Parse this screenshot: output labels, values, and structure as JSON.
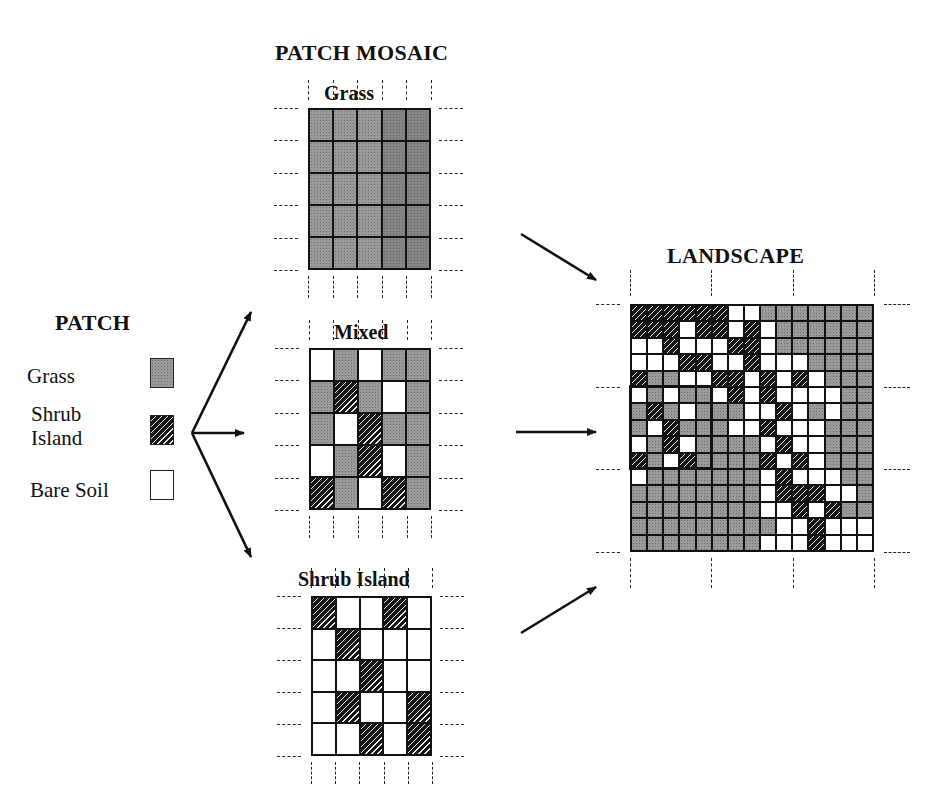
{
  "titles": {
    "patch": "PATCH",
    "patch_mosaic": "PATCH MOSAIC",
    "landscape": "LANDSCAPE"
  },
  "legend": {
    "items": [
      {
        "label": "Grass",
        "type": "G"
      },
      {
        "label": "Shrub Island",
        "label_lines": [
          "Shrub",
          "Island"
        ],
        "type": "S"
      },
      {
        "label": "Bare Soil",
        "type": "W"
      }
    ]
  },
  "mosaics": [
    {
      "label": "Grass",
      "rows": [
        [
          "G",
          "G",
          "G",
          "G",
          "G"
        ],
        [
          "G",
          "G",
          "G",
          "G",
          "G"
        ],
        [
          "G",
          "G",
          "G",
          "G",
          "G"
        ],
        [
          "G",
          "G",
          "G",
          "G",
          "G"
        ],
        [
          "G",
          "G",
          "G",
          "G",
          "G"
        ]
      ]
    },
    {
      "label": "Mixed",
      "rows": [
        [
          "W",
          "G",
          "W",
          "G",
          "G"
        ],
        [
          "G",
          "S",
          "G",
          "W",
          "G"
        ],
        [
          "G",
          "W",
          "S",
          "G",
          "G"
        ],
        [
          "W",
          "G",
          "S",
          "W",
          "G"
        ],
        [
          "S",
          "G",
          "W",
          "S",
          "G"
        ]
      ]
    },
    {
      "label": "Shrub Island",
      "rows": [
        [
          "S",
          "W",
          "W",
          "S",
          "W"
        ],
        [
          "W",
          "S",
          "W",
          "W",
          "W"
        ],
        [
          "W",
          "W",
          "S",
          "W",
          "W"
        ],
        [
          "W",
          "S",
          "W",
          "W",
          "S"
        ],
        [
          "W",
          "W",
          "S",
          "W",
          "S"
        ]
      ]
    }
  ],
  "landscape": {
    "rows": [
      [
        "S",
        "S",
        "S",
        "S",
        "S",
        "S",
        "W",
        "W",
        "G",
        "G",
        "G",
        "G",
        "G",
        "G",
        "G"
      ],
      [
        "S",
        "S",
        "S",
        "W",
        "S",
        "S",
        "W",
        "S",
        "W",
        "G",
        "G",
        "G",
        "G",
        "G",
        "G"
      ],
      [
        "W",
        "W",
        "S",
        "W",
        "W",
        "W",
        "S",
        "S",
        "W",
        "G",
        "G",
        "G",
        "G",
        "G",
        "G"
      ],
      [
        "W",
        "W",
        "W",
        "S",
        "S",
        "W",
        "W",
        "S",
        "W",
        "W",
        "W",
        "G",
        "G",
        "G",
        "G"
      ],
      [
        "S",
        "G",
        "G",
        "W",
        "W",
        "S",
        "S",
        "W",
        "S",
        "W",
        "S",
        "W",
        "G",
        "G",
        "G"
      ],
      [
        "W",
        "G",
        "W",
        "G",
        "G",
        "W",
        "S",
        "W",
        "S",
        "W",
        "W",
        "W",
        "W",
        "G",
        "G"
      ],
      [
        "G",
        "S",
        "G",
        "W",
        "G",
        "G",
        "G",
        "W",
        "W",
        "S",
        "W",
        "G",
        "W",
        "G",
        "G"
      ],
      [
        "G",
        "W",
        "S",
        "G",
        "G",
        "G",
        "W",
        "W",
        "S",
        "W",
        "W",
        "W",
        "G",
        "G",
        "G"
      ],
      [
        "W",
        "G",
        "S",
        "W",
        "G",
        "G",
        "G",
        "G",
        "W",
        "S",
        "W",
        "W",
        "G",
        "G",
        "G"
      ],
      [
        "S",
        "G",
        "W",
        "S",
        "G",
        "G",
        "G",
        "G",
        "S",
        "W",
        "S",
        "W",
        "G",
        "G",
        "G"
      ],
      [
        "W",
        "G",
        "G",
        "G",
        "G",
        "G",
        "G",
        "G",
        "W",
        "S",
        "W",
        "W",
        "W",
        "G",
        "G"
      ],
      [
        "G",
        "G",
        "G",
        "G",
        "G",
        "G",
        "G",
        "G",
        "W",
        "S",
        "S",
        "S",
        "W",
        "W",
        "G"
      ],
      [
        "G",
        "G",
        "G",
        "G",
        "G",
        "G",
        "G",
        "G",
        "W",
        "W",
        "S",
        "W",
        "S",
        "G",
        "G"
      ],
      [
        "G",
        "G",
        "G",
        "G",
        "G",
        "G",
        "G",
        "G",
        "G",
        "W",
        "W",
        "S",
        "W",
        "W",
        "W"
      ],
      [
        "G",
        "G",
        "G",
        "G",
        "G",
        "G",
        "G",
        "G",
        "W",
        "W",
        "W",
        "S",
        "W",
        "W",
        "W"
      ]
    ],
    "highlight_box": {
      "col": 0,
      "row": 5,
      "cols": 5,
      "rows": 5
    }
  },
  "colors": {
    "grass": "#9a9a9a",
    "shrub": "#151515",
    "bare_soil": "#ffffff",
    "line": "#111111"
  }
}
